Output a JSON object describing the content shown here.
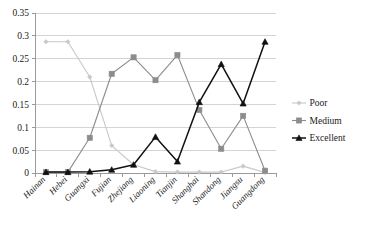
{
  "chart_data": {
    "type": "line",
    "title": "",
    "xlabel": "",
    "ylabel": "",
    "ylim": [
      0,
      0.35
    ],
    "ytick_labels": [
      "0",
      "0.05",
      "0.1",
      "0.15",
      "0.2",
      "0.25",
      "0.3",
      "0.35"
    ],
    "ytick_values": [
      0,
      0.05,
      0.1,
      0.15,
      0.2,
      0.25,
      0.3,
      0.35
    ],
    "grid": true,
    "legend_position": "right",
    "categories": [
      "Hainan",
      "Hebei",
      "Guangxi",
      "Fujian",
      "Zhejiang",
      "Liaoning",
      "Tianjin",
      "Shanghai",
      "Shandong",
      "Jiangsu",
      "Guangdong"
    ],
    "series": [
      {
        "name": "Poor",
        "color": "#c8c8c8",
        "marker": "diamond",
        "values": [
          0.287,
          0.287,
          0.21,
          0.06,
          0.018,
          0.003,
          0.002,
          0.002,
          0.002,
          0.015,
          0.001
        ]
      },
      {
        "name": "Medium",
        "color": "#8c8c8c",
        "marker": "square",
        "values": [
          0.002,
          0.002,
          0.077,
          0.217,
          0.253,
          0.203,
          0.258,
          0.138,
          0.053,
          0.125,
          0.005
        ]
      },
      {
        "name": "Excellent",
        "color": "#111111",
        "marker": "triangle",
        "values": [
          0.002,
          0.002,
          0.003,
          0.007,
          0.018,
          0.079,
          0.025,
          0.155,
          0.238,
          0.152,
          0.287
        ]
      }
    ]
  },
  "legend": {
    "items": [
      {
        "label": "Poor"
      },
      {
        "label": "Medium"
      },
      {
        "label": "Excellent"
      }
    ]
  }
}
